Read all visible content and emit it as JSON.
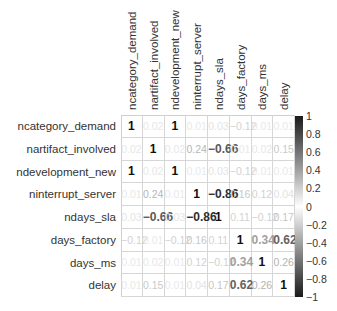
{
  "chart_data": {
    "type": "heatmap",
    "title": "",
    "xlabel": "",
    "ylabel": "",
    "variables": [
      "ncategory_demand",
      "nartifact_involved",
      "ndevelopment_new",
      "ninterrupt_server",
      "ndays_sla",
      "days_factory",
      "days_ms",
      "delay"
    ],
    "matrix": [
      [
        1,
        0.02,
        1,
        0.01,
        0.03,
        -0.12,
        0.01,
        0.01
      ],
      [
        0.02,
        1,
        0.02,
        0.24,
        -0.66,
        0.01,
        0.02,
        0.15
      ],
      [
        1,
        0.02,
        1,
        0.01,
        0.03,
        -0.12,
        0.01,
        0.01
      ],
      [
        0.01,
        0.24,
        0.01,
        1,
        -0.86,
        0.16,
        0.12,
        0.04
      ],
      [
        0.03,
        -0.66,
        0.03,
        -0.86,
        1,
        0.11,
        -0.12,
        0.17
      ],
      [
        -0.12,
        0.01,
        -0.12,
        0.16,
        0.11,
        1,
        0.34,
        0.62
      ],
      [
        0.01,
        0.02,
        0.01,
        0.12,
        -0.12,
        0.34,
        1,
        0.26
      ],
      [
        0.01,
        0.15,
        0.01,
        0.04,
        0.17,
        0.62,
        0.26,
        1
      ]
    ],
    "colorbar": {
      "range": [
        -1,
        1
      ],
      "ticks": [
        "1",
        "0.8",
        "0.6",
        "0.4",
        "0.2",
        "0",
        "-0.2",
        "-0.4",
        "-0.6",
        "-0.8",
        "-1"
      ],
      "colors": {
        "high": "#1a1a1a",
        "mid": "#ffffff",
        "low": "#1a1a1a"
      }
    },
    "grid": true,
    "legend_position": "right"
  }
}
